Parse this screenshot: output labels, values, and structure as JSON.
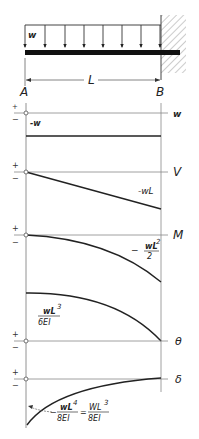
{
  "beam": {
    "load_label": "w",
    "span_label": "L",
    "left_end_label": "A",
    "right_end_label": "B",
    "support": "fixed wall at B"
  },
  "diagrams": [
    {
      "id": "load",
      "axis_label": "w",
      "plus": "+",
      "minus": "−",
      "annotation": "-w"
    },
    {
      "id": "shear",
      "axis_label": "V",
      "plus": "+",
      "minus": "−",
      "annotation": "-wL"
    },
    {
      "id": "moment",
      "axis_label": "M",
      "plus": "+",
      "minus": "−",
      "annotation_prefix": "−",
      "annotation_num": "wL",
      "annotation_exp": "2",
      "annotation_den": "2"
    },
    {
      "id": "slope",
      "axis_label": "θ",
      "plus": "+",
      "minus": "−",
      "annotation_num": "wL",
      "annotation_exp": "3",
      "annotation_den": "6EI"
    },
    {
      "id": "deflection",
      "axis_label": "δ",
      "plus": "+",
      "minus": "−",
      "annotation_prefix": "−",
      "annotation_num": "wL",
      "annotation_exp": "4",
      "annotation_den": "8EI",
      "equals": "=",
      "annotation2_num": "WL",
      "annotation2_exp": "3",
      "annotation2_den": "8EI"
    }
  ],
  "colors": {
    "line": "#222222",
    "axis": "#888888",
    "hatch": "#999999"
  }
}
